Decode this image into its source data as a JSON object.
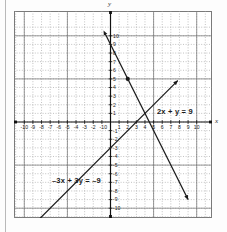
{
  "figure": {
    "type": "coordinate-plane",
    "axis_labels": {
      "x": "x",
      "y": "y"
    }
  },
  "chart_data": {
    "type": "line",
    "title": "",
    "subtitle": "",
    "xlabel": "x",
    "ylabel": "y",
    "xlim": [
      -10.8,
      10.8
    ],
    "ylim": [
      -10.8,
      10.8
    ],
    "grid": true,
    "grid_step": 1,
    "legend_position": "inline-annotation",
    "xticks": [
      -10,
      -9,
      -8,
      -7,
      -6,
      -5,
      -4,
      -3,
      -2,
      -1,
      0,
      1,
      2,
      3,
      4,
      5,
      6,
      7,
      8,
      9,
      10
    ],
    "yticks": [
      -10,
      -9,
      -8,
      -7,
      -6,
      -5,
      -4,
      -3,
      -2,
      -1,
      0,
      1,
      2,
      3,
      4,
      5,
      6,
      7,
      8,
      9,
      10
    ],
    "xtick_labels": [
      "-10",
      "-9",
      "-8",
      "-7",
      "-6",
      "-5",
      "-4",
      "-3",
      "-2",
      "-1",
      "0",
      "1",
      "2",
      "3",
      "4",
      "5",
      "6",
      "7",
      "8",
      "9",
      "10"
    ],
    "ytick_labels": [
      "-10",
      "-9",
      "-8",
      "-7",
      "-6",
      "-5",
      "-4",
      "-3",
      "-2",
      "-1",
      "0",
      "1",
      "2",
      "3",
      "4",
      "5",
      "6",
      "7",
      "8",
      "9",
      "10"
    ],
    "series": [
      {
        "name": "2x + y = 9",
        "label": "2x + y = 9",
        "equation": "2x + y = 9",
        "slope": -2,
        "y_intercept": 9,
        "color": "#1a1a1a",
        "arrows": "both",
        "x": [
          -0.6,
          9.0
        ],
        "y": [
          10.2,
          -9.0
        ]
      },
      {
        "name": "-3x + 3y = -9",
        "label": "–3x + 3y = –9",
        "equation": "-3x + 3y = -9",
        "slope": 1,
        "y_intercept": -3,
        "color": "#1a1a1a",
        "arrows": "both",
        "x": [
          -10.4,
          7.8
        ],
        "y": [
          -13.4,
          4.8
        ]
      }
    ],
    "annotations": [
      {
        "text": "2x + y = 9",
        "x": 4.0,
        "y": 2.3
      },
      {
        "text": "–3x + 3y = –9",
        "x": -7.6,
        "y": -5.6
      }
    ],
    "points": [
      {
        "label": "",
        "x": 2,
        "y": 5,
        "marker": "filled-circle",
        "color": "#1a1a1a"
      }
    ]
  }
}
